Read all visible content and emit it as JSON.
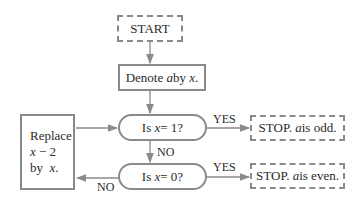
{
  "flowchart": {
    "start": "START",
    "denote": {
      "pre": "Denote ",
      "var1": "a",
      "mid": " by ",
      "var2": "x",
      "post": "."
    },
    "decision1": {
      "pre": "Is ",
      "var": "x",
      "post": " = 1?"
    },
    "decision2": {
      "pre": "Is ",
      "var": "x",
      "post": " = 0?"
    },
    "replace": {
      "line1": "Replace",
      "line2_var": "x",
      "line2_rest": " − 2",
      "line3_pre": "by ",
      "line3_var": "x",
      "line3_post": "."
    },
    "stop_odd": {
      "pre": "STOP. ",
      "var": "a",
      "post": " is odd."
    },
    "stop_even": {
      "pre": "STOP. ",
      "var": "a",
      "post": " is even."
    },
    "labels": {
      "yes1": "YES",
      "yes2": "YES",
      "no1": "NO",
      "no2": "NO"
    }
  }
}
